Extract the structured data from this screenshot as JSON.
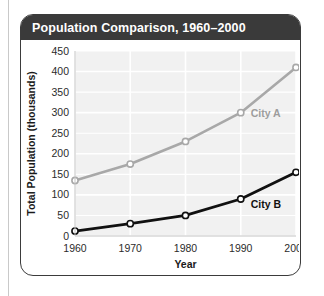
{
  "card": {
    "title": "Population Comparison, 1960–2000"
  },
  "chart_data": {
    "type": "line",
    "title": "Population Comparison, 1960–2000",
    "xlabel": "Year",
    "ylabel": "Total Population (thousands)",
    "x": [
      1960,
      1970,
      1980,
      1990,
      2000
    ],
    "xticklabels": [
      "1960",
      "1970",
      "1980",
      "1990",
      "2000"
    ],
    "yticks": [
      0,
      50,
      100,
      150,
      200,
      250,
      300,
      350,
      400,
      450
    ],
    "yticklabels": [
      "0",
      "50",
      "100",
      "150",
      "200",
      "250",
      "300",
      "350",
      "400",
      "450"
    ],
    "ylim": [
      0,
      450
    ],
    "xlim": [
      1960,
      2000
    ],
    "grid": true,
    "legend": "inline-labels",
    "series": [
      {
        "name": "City A",
        "color": "#a8a8a8",
        "label_color": "#9d9d9d",
        "values": [
          135,
          175,
          230,
          300,
          410
        ]
      },
      {
        "name": "City B",
        "color": "#111111",
        "label_color": "#111111",
        "values": [
          12,
          30,
          50,
          90,
          155
        ]
      }
    ],
    "plot_background": "#f1f1f1",
    "gridline_color": "#ffffff",
    "marker": "open-circle"
  }
}
